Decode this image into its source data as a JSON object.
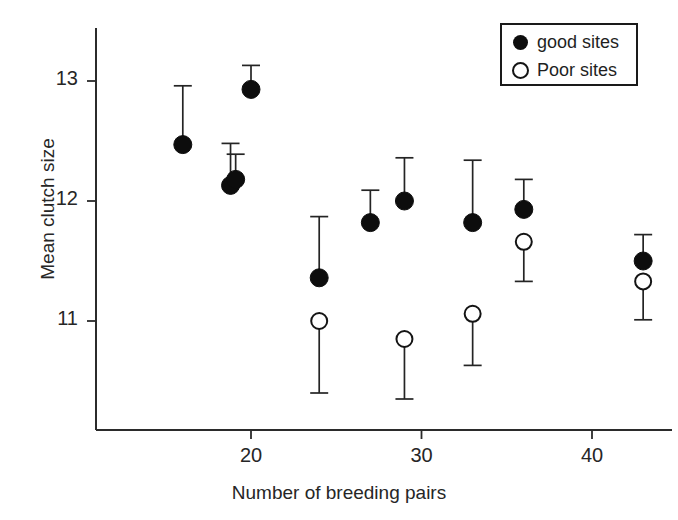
{
  "chart_data": {
    "type": "scatter",
    "title": "",
    "xlabel": "Number of breeding pairs",
    "ylabel": "Mean clutch size",
    "xlim": [
      13.5,
      47
    ],
    "ylim": [
      10.25,
      13.35
    ],
    "xticks": [
      20,
      30,
      40
    ],
    "xtick_labels": [
      "20",
      "30",
      "40"
    ],
    "yticks": [
      11,
      12,
      13
    ],
    "ytick_labels": [
      "11",
      "12",
      "13"
    ],
    "grid": false,
    "legend_position": "top-right",
    "error_bar_style": "single-sided",
    "series": [
      {
        "name": "good sites",
        "marker": "filled-circle",
        "color": "#0d0d0d",
        "points": [
          {
            "x": 16,
            "y": 12.47,
            "err_top": 12.96,
            "err_bottom": 12.47
          },
          {
            "x": 18.8,
            "y": 12.13,
            "err_top": 12.48,
            "err_bottom": 12.13
          },
          {
            "x": 19.1,
            "y": 12.18,
            "err_top": 12.39,
            "err_bottom": 12.18
          },
          {
            "x": 20,
            "y": 12.93,
            "err_top": 13.13,
            "err_bottom": 12.93
          },
          {
            "x": 24,
            "y": 11.36,
            "err_top": 11.87,
            "err_bottom": 11.36
          },
          {
            "x": 27,
            "y": 11.82,
            "err_top": 12.09,
            "err_bottom": 11.82
          },
          {
            "x": 29,
            "y": 12.0,
            "err_top": 12.36,
            "err_bottom": 12.0
          },
          {
            "x": 33,
            "y": 11.82,
            "err_top": 12.34,
            "err_bottom": 11.82
          },
          {
            "x": 36,
            "y": 11.93,
            "err_top": 12.18,
            "err_bottom": 11.93
          },
          {
            "x": 43,
            "y": 11.5,
            "err_top": 11.72,
            "err_bottom": 11.5
          }
        ]
      },
      {
        "name": "Poor sites",
        "marker": "open-circle",
        "color": "#ffffff",
        "points": [
          {
            "x": 24,
            "y": 11.0,
            "err_top": 11.0,
            "err_bottom": 10.4
          },
          {
            "x": 29,
            "y": 10.85,
            "err_top": 10.85,
            "err_bottom": 10.35
          },
          {
            "x": 33,
            "y": 11.06,
            "err_top": 11.06,
            "err_bottom": 10.63
          },
          {
            "x": 36,
            "y": 11.66,
            "err_top": 11.66,
            "err_bottom": 11.33
          },
          {
            "x": 43,
            "y": 11.33,
            "err_top": 11.33,
            "err_bottom": 11.01
          }
        ]
      }
    ]
  },
  "legend": {
    "entries": [
      {
        "label": "good sites",
        "marker": "filled-circle"
      },
      {
        "label": "Poor sites",
        "marker": "open-circle"
      }
    ]
  },
  "axes": {
    "x_title": "Number of breeding pairs",
    "y_title": "Mean clutch size"
  }
}
